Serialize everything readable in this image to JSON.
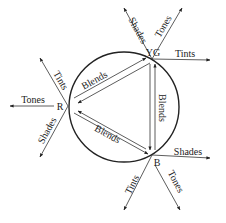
{
  "diagram": {
    "type": "color-triangle-blend-diagram",
    "background": "#ffffff",
    "stroke_color": "#222222",
    "circle": {
      "cx": 124,
      "cy": 107,
      "r": 55
    },
    "nodes": [
      {
        "id": "YG",
        "label": "YG",
        "x": 152,
        "y": 59
      },
      {
        "id": "R",
        "label": "R",
        "x": 68,
        "y": 106
      },
      {
        "id": "B",
        "label": "B",
        "x": 152,
        "y": 155
      }
    ],
    "blends": [
      {
        "from": "R",
        "to": "YG",
        "label": "Blends"
      },
      {
        "from": "YG",
        "to": "B",
        "label": "Blends"
      },
      {
        "from": "R",
        "to": "B",
        "label": "Blends"
      }
    ],
    "rays": {
      "YG": [
        {
          "label": "Shades",
          "to": [
            124,
            8
          ]
        },
        {
          "label": "Tones",
          "to": [
            182,
            8
          ]
        },
        {
          "label": "Tints",
          "to": [
            210,
            60
          ]
        }
      ],
      "R": [
        {
          "label": "Tints",
          "to": [
            40,
            58
          ]
        },
        {
          "label": "Tones",
          "to": [
            10,
            106
          ]
        },
        {
          "label": "Shades",
          "to": [
            40,
            157
          ]
        }
      ],
      "B": [
        {
          "label": "Shades",
          "to": [
            210,
            158
          ]
        },
        {
          "label": "Tints",
          "to": [
            124,
            210
          ]
        },
        {
          "label": "Tones",
          "to": [
            180,
            210
          ]
        }
      ]
    }
  }
}
